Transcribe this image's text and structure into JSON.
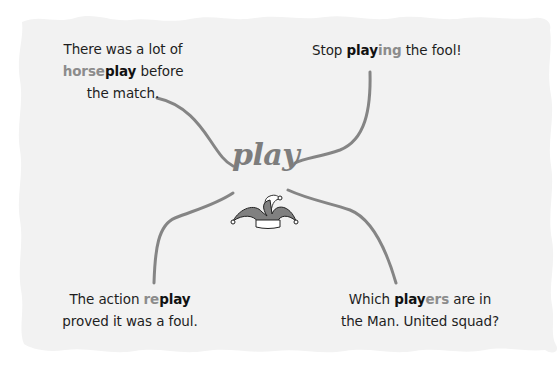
{
  "diagram": {
    "center": {
      "word": "play"
    },
    "icon": "jester-hat-icon",
    "colors": {
      "paper": "#f2f2f2",
      "connector": "#858585",
      "root_text": "#111111",
      "affix_text": "#8c8c8c",
      "center_text": "#7d7d7d"
    },
    "examples": [
      {
        "position": "top-left",
        "line1": "There was a lot of",
        "affix": "horse",
        "root": "play",
        "after": " before",
        "line3": "the match."
      },
      {
        "position": "top-right",
        "before": "Stop ",
        "root": "play",
        "affix": "ing",
        "after": " the fool!"
      },
      {
        "position": "bottom-left",
        "before": "The action ",
        "affix": "re",
        "root": "play",
        "line2": "proved it was a foul."
      },
      {
        "position": "bottom-right",
        "before": "Which ",
        "root": "play",
        "affix": "ers",
        "after": " are in",
        "line2": "the Man. United squad?"
      }
    ]
  }
}
